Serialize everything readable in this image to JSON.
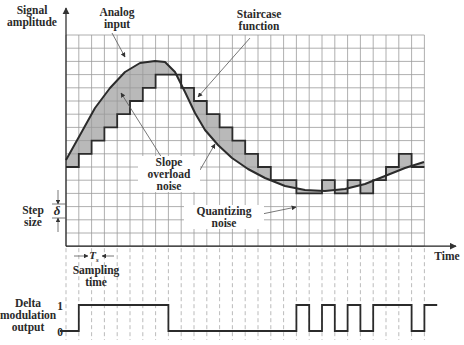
{
  "labels": {
    "y_axis": [
      "Signal",
      "amplitude"
    ],
    "analog_input": [
      "Analog",
      "input"
    ],
    "staircase": [
      "Staircase",
      "function"
    ],
    "slope_overload": [
      "Slope",
      "overload",
      "noise"
    ],
    "quantizing": [
      "Quantizing",
      "noise"
    ],
    "step_size": [
      "Step",
      "size"
    ],
    "delta_symbol": "δ",
    "ts_symbol": "T",
    "ts_sub": "s",
    "sampling_time": [
      "Sampling",
      "time"
    ],
    "time_axis": "Time",
    "delta_output": [
      "Delta",
      "modulation",
      "output"
    ],
    "level_one": "1",
    "level_zero": "0"
  },
  "grid": {
    "x0": 66,
    "y0": 35,
    "cols": 28,
    "rows": 16,
    "dx": 12.8,
    "dy": 13.2
  },
  "colors": {
    "grid": "#9a9a9a",
    "curve": "#2b2b2b",
    "fill": "#b9b9b9",
    "dash": "#aaaaaa"
  },
  "staircase_levels_row": [
    10,
    9,
    8,
    7,
    6,
    5,
    4,
    3,
    3,
    4,
    5,
    6,
    7,
    8,
    9,
    10,
    11,
    11,
    12,
    12,
    11,
    12,
    11,
    12,
    11,
    10,
    9,
    10
  ],
  "analog_curve_points": [
    [
      66,
      160
    ],
    [
      80,
      135
    ],
    [
      95,
      108
    ],
    [
      110,
      88
    ],
    [
      125,
      72
    ],
    [
      140,
      63
    ],
    [
      155,
      61
    ],
    [
      165,
      62
    ],
    [
      175,
      72
    ],
    [
      185,
      92
    ],
    [
      195,
      113
    ],
    [
      205,
      130
    ],
    [
      218,
      145
    ],
    [
      232,
      158
    ],
    [
      248,
      169
    ],
    [
      265,
      178
    ],
    [
      285,
      186
    ],
    [
      305,
      190
    ],
    [
      325,
      191
    ],
    [
      345,
      189
    ],
    [
      365,
      184
    ],
    [
      385,
      176
    ],
    [
      405,
      168
    ],
    [
      424,
      162
    ]
  ],
  "delta_bits": [
    0,
    1,
    1,
    1,
    1,
    1,
    1,
    1,
    0,
    0,
    0,
    0,
    0,
    0,
    0,
    0,
    0,
    0,
    1,
    0,
    1,
    0,
    1,
    0,
    1,
    1,
    1,
    0,
    1
  ]
}
